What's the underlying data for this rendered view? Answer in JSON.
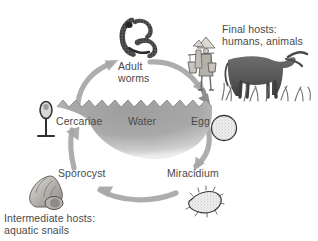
{
  "figure": {
    "kind": "schistosomiasis-life-cycle-diagram",
    "background_color": "#ffffff",
    "text_color": "#4a4a4a",
    "water_color": "#a8a8a8",
    "arrow_color": "#a6a6a6"
  },
  "cycle_labels": {
    "adult_worms_line1": "Adult",
    "adult_worms_line2": "worms",
    "cercariae": "Cercariae",
    "water": "Water",
    "egg": "Egg",
    "sporocyst": "Sporocyst",
    "miracidium": "Miracidium"
  },
  "annotations": {
    "final_hosts_line1": "Final hosts:",
    "final_hosts_line2": "humans, animals",
    "intermediate_hosts_line1": "Intermediate hosts:",
    "intermediate_hosts_line2": "aquatic snails"
  },
  "illustrations": [
    {
      "name": "adult-worm-pair-illustration",
      "stage": "Adult worms"
    },
    {
      "name": "human-with-yoke-illustration",
      "stage": "Final host human"
    },
    {
      "name": "water-buffalo-illustration",
      "stage": "Final host animal"
    },
    {
      "name": "egg-illustration",
      "stage": "Egg"
    },
    {
      "name": "miracidium-illustration",
      "stage": "Miracidium"
    },
    {
      "name": "snail-shell-illustration",
      "stage": "Sporocyst / intermediate host"
    },
    {
      "name": "cercaria-illustration",
      "stage": "Cercariae"
    },
    {
      "name": "water-body-illustration",
      "stage": "Water"
    }
  ],
  "arrows": [
    {
      "name": "arrow-cercariae-to-adult-worms",
      "direction": "up-right"
    },
    {
      "name": "arrow-adult-worms-to-final-hosts",
      "direction": "down-right"
    },
    {
      "name": "arrow-final-hosts-to-egg",
      "direction": "down"
    },
    {
      "name": "arrow-egg-to-miracidium",
      "direction": "down-left"
    },
    {
      "name": "arrow-miracidium-to-sporocyst",
      "direction": "left"
    },
    {
      "name": "arrow-sporocyst-to-cercariae",
      "direction": "up"
    }
  ]
}
